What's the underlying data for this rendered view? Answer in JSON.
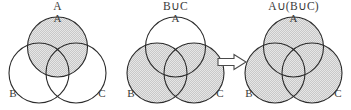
{
  "figure": {
    "kind": "venn-diagram-sequence",
    "width": 351,
    "height": 110,
    "background_color": "#ffffff",
    "stroke_color": "#2b2b2b",
    "shade_color": "#d9d9d9",
    "text_color": "#3a3a3a"
  },
  "panels": [
    {
      "id": "panel-a",
      "title": "A",
      "circle_labels": {
        "a": "A",
        "b": "B",
        "c": "C"
      },
      "shaded_regions": [
        "A"
      ],
      "description": "Set A shaded"
    },
    {
      "id": "panel-b-union-c",
      "title": "B∪C",
      "circle_labels": {
        "a": "A",
        "b": "B",
        "c": "C"
      },
      "shaded_regions": [
        "B",
        "C"
      ],
      "description": "Union of B and C shaded"
    },
    {
      "id": "panel-a-union-b-union-c",
      "title": "A∪(B∪C)",
      "circle_labels": {
        "a": "A",
        "b": "B",
        "c": "C"
      },
      "shaded_regions": [
        "A",
        "B",
        "C"
      ],
      "description": "Union of A with B union C shaded"
    }
  ],
  "connector": {
    "symbol": "⟹",
    "name": "implies-arrow",
    "style": "hollow-double-arrow"
  },
  "geometry": {
    "radius": 30,
    "circle_a": {
      "cx": 57.5,
      "cy": 34
    },
    "circle_b": {
      "cx": 39,
      "cy": 60
    },
    "circle_c": {
      "cx": 76,
      "cy": 60
    }
  }
}
